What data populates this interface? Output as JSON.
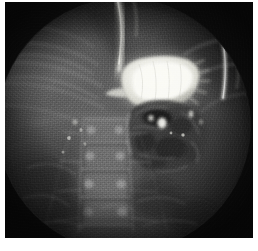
{
  "document": {
    "kind": "radiograph",
    "modality_label": "Fluoroscopic upper gastrointestinal contrast radiograph",
    "orientation": "frontal",
    "has_visible_text": false,
    "caption": ""
  },
  "page": {
    "width_px": 258,
    "height_px": 251,
    "paper_color": "#ffffff",
    "margin_left_px": 5,
    "margin_top_px": 2,
    "margin_right_px": 5,
    "margin_bottom_px": 13
  },
  "plate": {
    "width_px": 248,
    "height_px": 236,
    "background_color": "#0a0a0a",
    "corner_color": "#101010",
    "field_shape": "circle",
    "field_center_x_pct": 48,
    "field_center_y_pct": 52,
    "field_radius_pct": 52,
    "field_base_color": "#4a4a4a"
  },
  "tones": {
    "black": "#080808",
    "dark": "#1d1d1d",
    "mid_dark": "#343434",
    "mid": "#565656",
    "mid_light": "#7b7b7b",
    "light": "#a8a8a8",
    "bright": "#d8d8d8",
    "contrast_white": "#f2f2ee"
  },
  "anatomy": [
    {
      "id": "collimated-field",
      "label": "Circular collimated fluoroscopy field",
      "brightness": "mid",
      "note": "Bright circular exposure area with dark unexposed corners"
    },
    {
      "id": "contrast-column-esophagus",
      "label": "Vertical barium column in distal esophagus",
      "brightness": "bright",
      "position": "top center"
    },
    {
      "id": "stomach-barium-pool",
      "label": "Barium-filled gastric body and fundus",
      "brightness": "contrast_white",
      "position": "upper middle, left of midline on image",
      "approx_bounds_px": [
        113,
        58,
        82,
        50
      ]
    },
    {
      "id": "gastric-antrum-duodenal-loop",
      "label": "Mottled gastric antrum and duodenal loop",
      "brightness": "mid_dark",
      "position": "center, below barium pool",
      "approx_bounds_px": [
        122,
        100,
        78,
        72
      ]
    },
    {
      "id": "contrast-specks-duodenum",
      "label": "Residual contrast specks within duodenum",
      "brightness": "bright"
    },
    {
      "id": "lumbar-spine",
      "label": "Lumbar vertebral column with vertebral bodies and pedicles",
      "brightness": "mid_light",
      "position": "lower center-left",
      "approx_bounds_px": [
        66,
        120,
        58,
        110
      ]
    },
    {
      "id": "rib-shadows-left",
      "label": "Lower rib shadows arcing across upper left",
      "brightness": "mid_light",
      "position": "upper left"
    },
    {
      "id": "rib-streak-right",
      "label": "Bright curvilinear rib / device streak at right field margin",
      "brightness": "bright",
      "position": "upper right"
    },
    {
      "id": "soft-tissue-background",
      "label": "Abdominal soft tissue background density",
      "brightness": "mid"
    }
  ]
}
